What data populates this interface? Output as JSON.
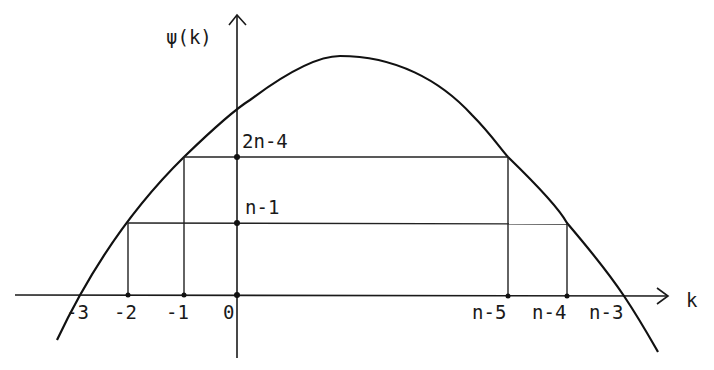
{
  "diagram": {
    "type": "function-plot",
    "y_axis": {
      "label": "ψ(k)"
    },
    "x_axis": {
      "label": "k"
    },
    "x_ticks": [
      {
        "label": "-3",
        "x": 80
      },
      {
        "label": "-2",
        "x": 128
      },
      {
        "label": "-1",
        "x": 184
      },
      {
        "label": "0",
        "x": 237
      },
      {
        "label": "n-5",
        "x": 508
      },
      {
        "label": "n-4",
        "x": 567
      },
      {
        "label": "n-3",
        "x": 624
      }
    ],
    "y_levels": [
      {
        "label": "2n-4",
        "y": 157,
        "from_tick": "-1",
        "to_tick": "n-5"
      },
      {
        "label": "n-1",
        "y": 223,
        "from_tick": "-2",
        "to_tick": "n-4"
      }
    ],
    "curve": {
      "shape": "concave-down parabola",
      "roots": [
        "-3",
        "n-3"
      ]
    },
    "colors": {
      "ink": "#111111",
      "background": "#ffffff"
    }
  }
}
